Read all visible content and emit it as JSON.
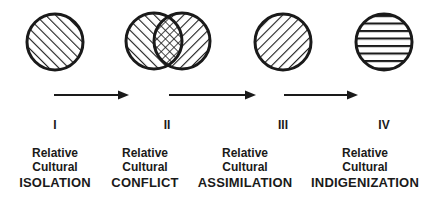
{
  "diagram": {
    "colors": {
      "ink": "#1a1a1a",
      "background": "#ffffff"
    },
    "stages": [
      {
        "numeral": "I",
        "line1": "Relative",
        "line2": "Cultural",
        "term": "ISOLATION",
        "pattern": "diagonal-up",
        "circles": 1
      },
      {
        "numeral": "II",
        "line1": "Relative",
        "line2": "Cultural",
        "term": "CONFLICT",
        "pattern": "overlap-crosshatch",
        "circles": 2
      },
      {
        "numeral": "III",
        "line1": "Relative",
        "line2": "Cultural",
        "term": "ASSIMILATION",
        "pattern": "diagonal-down",
        "circles": 1
      },
      {
        "numeral": "IV",
        "line1": "Relative",
        "line2": "Cultural",
        "term": "INDIGENIZATION",
        "pattern": "horizontal",
        "circles": 1
      }
    ],
    "arrows": [
      {
        "from": "I",
        "to": "II"
      },
      {
        "from": "II",
        "to": "III"
      },
      {
        "from": "III",
        "to": "IV"
      }
    ]
  }
}
